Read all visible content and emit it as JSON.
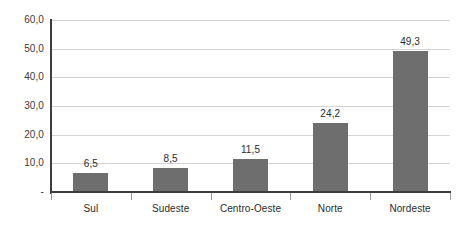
{
  "chart_data": {
    "type": "bar",
    "title": "",
    "subtitle": "",
    "xlabel": "",
    "ylabel": "",
    "categories": [
      "Sul",
      "Sudeste",
      "Centro-Oeste",
      "Norte",
      "Nordeste"
    ],
    "values": [
      6.5,
      8.5,
      11.5,
      24.2,
      49.3
    ],
    "value_labels": [
      "6,5",
      "8,5",
      "11,5",
      "24,2",
      "49,3"
    ],
    "ylim": [
      0,
      60
    ],
    "ytick_values": [
      60,
      50,
      40,
      30,
      20,
      10,
      0
    ],
    "ytick_labels": [
      "60,0",
      "50,0",
      "40,0",
      "30,0",
      "20,0",
      "10,0",
      "-"
    ],
    "grid": true,
    "legend": false,
    "legend_position": "none",
    "decimal_separator": ",",
    "bar_color": "#6e6e6e",
    "gridline_color": "#d4d4d4",
    "axis_color": "#3d3d3d",
    "text_color": "#2b2b2b",
    "background_color": "#ffffff"
  },
  "title_remnant": ""
}
